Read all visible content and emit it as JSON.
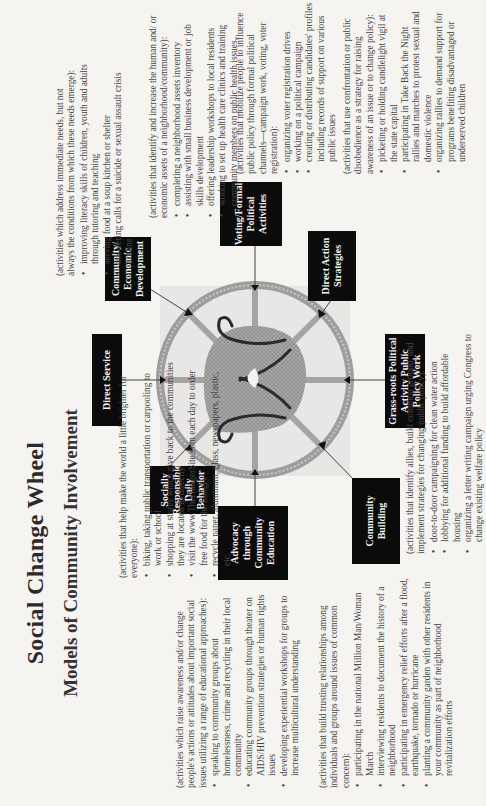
{
  "title": "Social Change Wheel",
  "subtitle": "Models of Community Involvement",
  "wheel": {
    "icon": "wheel-hands-emblem-icon",
    "colors": {
      "ring": "#9a9a9a",
      "emblem_fill": "#8e8e8e",
      "emblem_stroke": "#2a2a2a",
      "box_bg": "#0b0b0b",
      "box_text": "#f1f1f1"
    },
    "spokes": [
      {
        "id": "direct-service",
        "label": "Direct Service"
      },
      {
        "id": "community-economic-development",
        "label": "Community/ Economic Development"
      },
      {
        "id": "voting-formal-political-activities",
        "label": "Voting/Formal Political Activities"
      },
      {
        "id": "direct-action-strategies",
        "label": "Direct Action Strategies"
      },
      {
        "id": "grass-roots-political-activity",
        "label": "Grass-roots Political Activity Public Policy Work"
      },
      {
        "id": "community-building",
        "label": "Community Building"
      },
      {
        "id": "advocacy-through-community-education",
        "label": "Advocacy through Community Education"
      },
      {
        "id": "socially-responsible-daily-behavior",
        "label": "Socially Responsible Daily Behavior"
      }
    ]
  },
  "sections": {
    "direct_service": {
      "intro": "(activities which address immediate needs, but not always the conditions from which these needs emerge):",
      "bullets": [
        "improving literacy skills of children, youth and adults through tutoring and teaching",
        "serving food at a soup kitchen or shelter",
        "answering calls for a suicide or sexual assault crisis hotline"
      ]
    },
    "community_economic_development": {
      "intro": "(activities that identify and increase the human and/ or economic assets of a neighborhood/community):",
      "bullets": [
        "completing a neighborhood assets inventory",
        "assisting with small business development or job skills development",
        "offering leadership workshops to local residents",
        "working to set up health care clinics and training community members on public health issues."
      ]
    },
    "voting_formal_political": {
      "intro": "(activities that mobilize people to influence public policy through formal political channels—campaign work, voting, voter registration):",
      "bullets": [
        "organizing voter registration drives",
        "working on a political campaign",
        "creating or distributing candidates' profiles including records of support on various public issues"
      ]
    },
    "direct_action": {
      "intro": "(activities that use confrontation or public disobedience as a strategy for raising awareness of an issue or to change policy):",
      "bullets": [
        "picketing or holding candlelight vigil at the state capital",
        "participating in Take Back the Night rallies and marches to protest sexual and domestic violence",
        "organizing rallies to demand support for programs benefiting disadvantaged or underserved children"
      ]
    },
    "grass_roots": {
      "intro": "(activities that identify allies, build common ground, and implement strategies for changing public policy):",
      "bullets": [
        "door-to-door campaigning for clean water action",
        "lobbying for additional funding to build affordable housing",
        "organizing a letter writing campaign urging Congress to change existing welfare policy"
      ]
    },
    "community_building": {
      "intro": "(activities that build trusting relationships among individuals and groups around issues of common concern):",
      "bullets": [
        "participating in the national Million Man/Woman March",
        "interviewing residents to document the history of a neighborhood",
        "participating in emergency relief efforts after a flood, earthquake, tornado or hurricane",
        "planting a community garden with other residents in your community as part of neighborhood revitalization efforts"
      ]
    },
    "advocacy": {
      "intro": "(activities which raise awareness and/or change people's actions or attitudes about important social issues utilizing a range of educational approaches):",
      "bullets": [
        "speaking to community groups about homelessness, crime and recycling in their local community",
        "educating community groups through theater on AIDS/HIV prevention strategies or human rights issues",
        "developing experiential workshops for groups to increase multicultural understanding"
      ]
    },
    "socially_responsible": {
      "intro": "(activities that help make the world a little brighter for everyone):",
      "bullets": [
        "biking, taking public transportation or carpooling to work or school",
        "shopping at stores which give back to the communities they are located in directly",
        "visit the www.TheHungerSite.com each day to order free food for the hungry",
        "recycle paper, aluminum, glass, newspapers, plastic, etc."
      ]
    }
  }
}
